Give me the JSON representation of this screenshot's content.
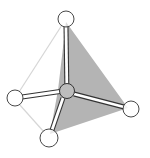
{
  "diagram": {
    "type": "tetrahedral-molecule",
    "colors": {
      "background": "#ffffff",
      "face_fill": "#b4b4b4",
      "edge_light": "#d8d8d8",
      "outline": "#333333",
      "atom_fill": "#ffffff",
      "center_fill": "#bdbdbd",
      "bond_fill": "#ffffff"
    },
    "central_atom": {
      "cx": 67,
      "cy": 91,
      "r": 8
    },
    "atoms": [
      {
        "id": "top",
        "cx": 66,
        "cy": 20,
        "r": 8
      },
      {
        "id": "left",
        "cx": 15,
        "cy": 98,
        "r": 8
      },
      {
        "id": "right",
        "cx": 131,
        "cy": 109,
        "r": 8
      },
      {
        "id": "bottom",
        "cx": 49,
        "cy": 138,
        "r": 9
      }
    ],
    "shaded_face": [
      [
        66,
        20
      ],
      [
        127,
        107
      ],
      [
        52,
        133
      ]
    ],
    "light_edges": [
      [
        [
          66,
          20
        ],
        [
          15,
          98
        ]
      ],
      [
        [
          15,
          98
        ],
        [
          49,
          138
        ]
      ]
    ]
  }
}
